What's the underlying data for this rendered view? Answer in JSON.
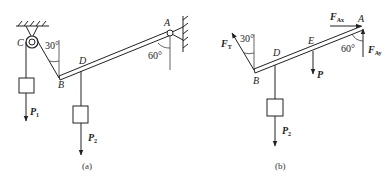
{
  "colors": {
    "stroke": "#222222",
    "background": "#ffffff"
  },
  "panel_a": {
    "caption": "(a)",
    "labels": {
      "C": "C",
      "B": "B",
      "D": "D",
      "A": "A"
    },
    "angles": {
      "rope": "30°",
      "beam": "60°"
    },
    "loads": {
      "p1": {
        "main": "P",
        "sub": "1"
      },
      "p2": {
        "main": "P",
        "sub": "2"
      }
    }
  },
  "panel_b": {
    "caption": "(b)",
    "labels": {
      "B": "B",
      "D": "D",
      "E": "E",
      "A": "A"
    },
    "angles": {
      "rope": "30°",
      "beam": "60°"
    },
    "forces": {
      "ft": {
        "main": "F",
        "sub": "T"
      },
      "p": {
        "main": "P",
        "sub": ""
      },
      "p2": {
        "main": "P",
        "sub": "2"
      },
      "fax": {
        "main": "F",
        "sub": "Ax"
      },
      "fay": {
        "main": "F",
        "sub": "Ay"
      }
    }
  }
}
